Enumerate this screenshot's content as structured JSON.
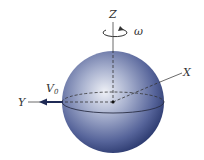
{
  "diagram": {
    "labels": {
      "z_axis": "Z",
      "x_axis": "X",
      "y_axis": "Y",
      "omega": "ω",
      "velocity": "V",
      "velocity_subscript": "0"
    },
    "colors": {
      "sphere_dark": "#2c3b6e",
      "sphere_mid": "#6a78a6",
      "sphere_light": "#e6e9f2",
      "line": "#333333"
    }
  }
}
